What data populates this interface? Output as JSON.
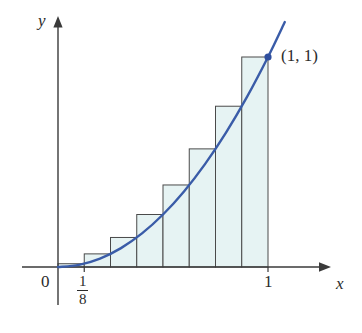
{
  "figure": {
    "axis_labels": {
      "x": "x",
      "y": "y"
    },
    "tick_labels": {
      "origin": "0",
      "x_one": "1",
      "x_eighth_numerator": "1",
      "x_eighth_denominator": "8"
    },
    "annotations": {
      "point_1_1": "(1, 1)"
    },
    "colors": {
      "curve": "#3a5ca8",
      "point_marker": "#2f4f9e",
      "rectangle_fill": "#e6f3f3",
      "rectangle_stroke": "#4a4a4a",
      "axis": "#3a3a3a",
      "text": "#2b2b2b",
      "background": "#ffffff"
    }
  },
  "chart_data": {
    "type": "bar",
    "title": "",
    "subtitle": "",
    "xlabel": "x",
    "ylabel": "y",
    "function": "y = x^2",
    "method": "right endpoint rectangles",
    "n_rectangles": 8,
    "interval": [
      0,
      1
    ],
    "subinterval_width": 0.125,
    "xlim": [
      0,
      1.15
    ],
    "ylim": [
      0,
      1.15
    ],
    "grid": false,
    "legend": false,
    "categories": [
      "0-1/8",
      "1/8-2/8",
      "2/8-3/8",
      "3/8-4/8",
      "4/8-5/8",
      "5/8-6/8",
      "6/8-7/8",
      "7/8-1"
    ],
    "right_endpoints": [
      0.125,
      0.25,
      0.375,
      0.5,
      0.625,
      0.75,
      0.875,
      1.0
    ],
    "values": [
      0.015625,
      0.0625,
      0.140625,
      0.25,
      0.390625,
      0.5625,
      0.765625,
      1.0
    ],
    "curve": {
      "name": "y = x^2",
      "x": [
        0,
        0.1,
        0.2,
        0.3,
        0.4,
        0.5,
        0.6,
        0.7,
        0.8,
        0.9,
        1.0,
        1.08
      ],
      "y": [
        0,
        0.01,
        0.04,
        0.09,
        0.16,
        0.25,
        0.36,
        0.49,
        0.64,
        0.81,
        1.0,
        1.1664
      ]
    },
    "annotated_points": [
      {
        "label": "(1, 1)",
        "x": 1,
        "y": 1
      }
    ],
    "xticks": [
      0,
      0.125,
      1
    ],
    "xticklabels": [
      "0",
      "1/8",
      "1"
    ]
  }
}
